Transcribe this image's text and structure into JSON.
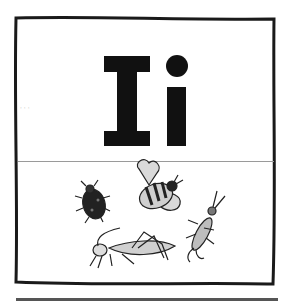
{
  "card": {
    "letters": "Ii",
    "upper_letter": "I",
    "lower_letter": "i",
    "illustration_subject": "insects",
    "insects": [
      "ladybug",
      "bee",
      "grasshopper",
      "earwig"
    ]
  },
  "colors": {
    "ink": "#111111",
    "frame": "#1a1a1a",
    "background": "#ffffff",
    "insect_fill": "#d6d6d6"
  }
}
